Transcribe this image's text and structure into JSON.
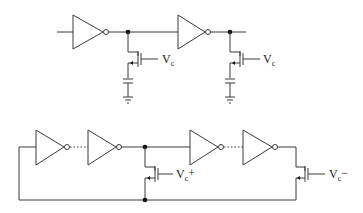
{
  "diagram": {
    "top_circuit": {
      "description": "Inverter chain with voltage-controlled capacitive load per stage",
      "stages": [
        {
          "control_label": {
            "main": "V",
            "sub": "c",
            "suffix": ""
          }
        },
        {
          "control_label": {
            "main": "V",
            "sub": "c",
            "suffix": ""
          }
        }
      ]
    },
    "bottom_circuit": {
      "description": "Ring oscillator with feedback through transistor",
      "labels": [
        {
          "main": "V",
          "sub": "c",
          "suffix": "+"
        },
        {
          "main": "V",
          "sub": "c",
          "suffix": "−"
        }
      ]
    }
  }
}
